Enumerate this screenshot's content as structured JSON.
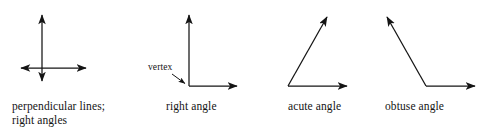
{
  "figure": {
    "background_color": "#ffffff",
    "stroke_color": "#141414",
    "text_color": "#141414"
  },
  "annotations": {
    "vertex_label": "vertex"
  },
  "captions": {
    "perpendicular": "perpendicular lines;\nright angles",
    "right_angle": "right angle",
    "acute_angle": "acute angle",
    "obtuse_angle": "obtuse angle"
  },
  "diagrams": [
    {
      "id": "perpendicular-lines",
      "caption": "perpendicular lines; right angles",
      "description": "Two double-headed arrows crossing at right angles",
      "rays": [
        {
          "name": "vertical-double-arrow",
          "x1": 42,
          "y1": 14,
          "x2": 42,
          "y2": 82,
          "arrow_start": true,
          "arrow_end": true
        },
        {
          "name": "horizontal-double-arrow",
          "x1": 20,
          "y1": 68,
          "x2": 87,
          "y2": 68,
          "arrow_start": true,
          "arrow_end": true
        }
      ],
      "intersection": {
        "x": 42,
        "y": 68
      },
      "angle_degrees": 90
    },
    {
      "id": "right-angle",
      "caption": "right angle",
      "description": "Two rays from a common vertex meeting at 90 degrees",
      "vertex": {
        "x": 189,
        "y": 86
      },
      "rays": [
        {
          "name": "upward-ray",
          "x1": 189,
          "y1": 86,
          "x2": 189,
          "y2": 14,
          "arrow_start": false,
          "arrow_end": true
        },
        {
          "name": "rightward-ray",
          "x1": 189,
          "y1": 86,
          "x2": 238,
          "y2": 86,
          "arrow_start": false,
          "arrow_end": true
        }
      ],
      "leader": {
        "name": "vertex-leader-arrow",
        "x1": 172,
        "y1": 74,
        "x2": 186,
        "y2": 84
      },
      "angle_degrees": 90
    },
    {
      "id": "acute-angle",
      "caption": "acute angle",
      "description": "Two rays from a common vertex meeting at less than 90 degrees",
      "vertex": {
        "x": 288,
        "y": 86
      },
      "rays": [
        {
          "name": "upward-right-ray",
          "x1": 288,
          "y1": 86,
          "x2": 328,
          "y2": 16,
          "arrow_start": false,
          "arrow_end": true
        },
        {
          "name": "rightward-ray",
          "x1": 288,
          "y1": 86,
          "x2": 348,
          "y2": 86,
          "arrow_start": false,
          "arrow_end": true
        }
      ],
      "angle_degrees": 60
    },
    {
      "id": "obtuse-angle",
      "caption": "obtuse angle",
      "description": "Two rays from a common vertex meeting at more than 90 degrees",
      "vertex": {
        "x": 426,
        "y": 86
      },
      "rays": [
        {
          "name": "upward-left-ray",
          "x1": 426,
          "y1": 86,
          "x2": 386,
          "y2": 16,
          "arrow_start": false,
          "arrow_end": true
        },
        {
          "name": "rightward-ray",
          "x1": 426,
          "y1": 86,
          "x2": 476,
          "y2": 86,
          "arrow_start": false,
          "arrow_end": true
        }
      ],
      "angle_degrees": 120
    }
  ]
}
